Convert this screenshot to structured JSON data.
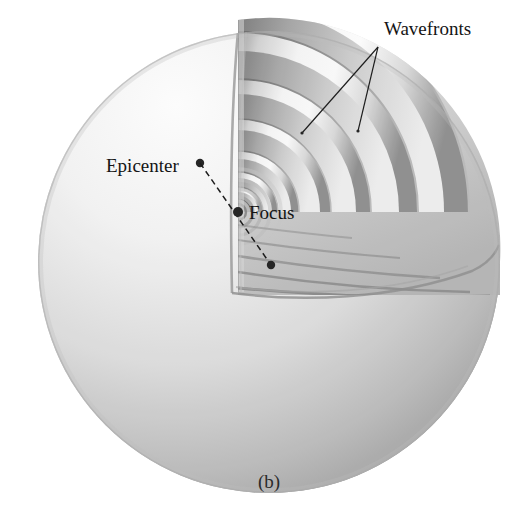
{
  "figure": {
    "caption": "(b)",
    "background_color": "#ffffff",
    "sphere": {
      "center_x": 269,
      "center_y": 262,
      "radius": 231,
      "light_direction": "upper-left highlight, lower-right shadow",
      "fill_light": "#fdfdfd",
      "fill_mid": "#cfcfcf",
      "fill_dark": "#8f8f8f",
      "rim": "#9a9a9a"
    },
    "labels": [
      {
        "id": "wavefronts",
        "text": "Wavefronts",
        "x": 384,
        "y": 35,
        "anchor": "start",
        "leader_targets": [
          [
            302,
            133
          ],
          [
            358,
            131
          ]
        ],
        "leader_origin": [
          378,
          47
        ]
      },
      {
        "id": "epicenter",
        "text": "Epicenter",
        "x": 106,
        "y": 172,
        "anchor": "start",
        "marker": [
          200,
          163
        ]
      },
      {
        "id": "focus",
        "text": "Focus",
        "x": 249,
        "y": 219,
        "anchor": "start",
        "marker": [
          238,
          212
        ]
      }
    ],
    "radius_line": {
      "from": [
        200,
        163
      ],
      "through": [
        238,
        212
      ],
      "to": [
        271,
        265
      ],
      "style": "dashed",
      "color": "#1d1d1d"
    },
    "wavefronts": {
      "count": 7,
      "origin": [
        238,
        212
      ],
      "description": "nested hemispherical shells expanding from the focus",
      "radii": [
        13,
        24,
        38,
        58,
        88,
        126,
        172,
        222
      ],
      "shell_thickness_ratio": 0.11,
      "face_light": "#f4f4f4",
      "face_shadow": "#8c8c8c",
      "edge": "#6f6f6f"
    },
    "cutaway": {
      "description": "quarter wedge removed from upper-right front of the sphere",
      "top_cut_x": 238,
      "bottom_cut_y": 290,
      "cut_face_tone": "#c6c6c6"
    },
    "colors": {
      "ink": "#141414",
      "leader": "#1d1d1d",
      "marker": "#262626",
      "paper": "#ffffff"
    }
  }
}
